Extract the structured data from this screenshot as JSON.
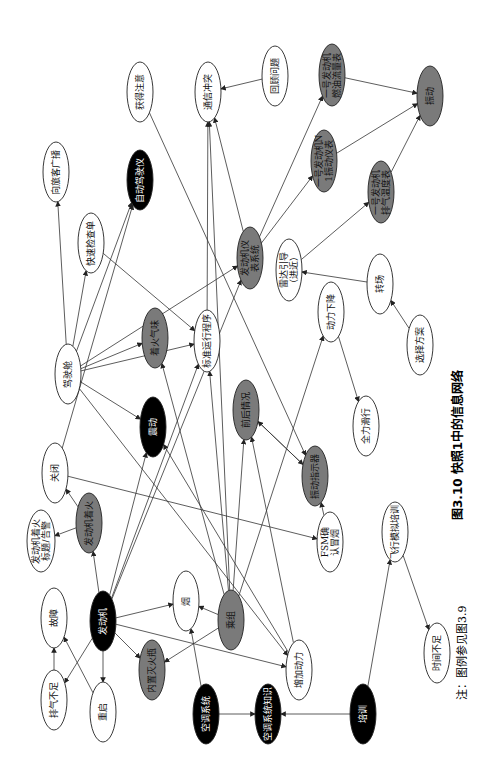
{
  "figure": {
    "caption": "图3.10  快照1中的信息网络",
    "note": "注：图例参见图3.9",
    "orientation": "rotated 90° clockwise"
  },
  "colors": {
    "black": "#000000",
    "gray": "#7a7a7a",
    "white": "#ffffff",
    "edge": "#333333"
  },
  "nodes": [
    {
      "id": "n1",
      "label": "获得注意",
      "fill": "white",
      "cx": 140,
      "cy": 92,
      "rx": 13,
      "ry": 30
    },
    {
      "id": "n2",
      "label": "通信冲突",
      "fill": "white",
      "cx": 208,
      "cy": 92,
      "rx": 13,
      "ry": 30
    },
    {
      "id": "n3",
      "label": "回顾问题",
      "fill": "white",
      "cx": 275,
      "cy": 76,
      "rx": 13,
      "ry": 30
    },
    {
      "id": "n4",
      "label": "一号发动机燃油流量表",
      "fill": "gray",
      "cx": 332,
      "cy": 75,
      "rx": 13,
      "ry": 31
    },
    {
      "id": "n5",
      "label": "振动",
      "fill": "gray",
      "cx": 430,
      "cy": 96,
      "rx": 13,
      "ry": 30
    },
    {
      "id": "n6",
      "label": "一号发动机N1振动仪表",
      "fill": "gray",
      "cx": 324,
      "cy": 161,
      "rx": 13,
      "ry": 31
    },
    {
      "id": "n7",
      "label": "一号发动机排气温度表",
      "fill": "gray",
      "cx": 381,
      "cy": 192,
      "rx": 13,
      "ry": 31
    },
    {
      "id": "n8",
      "label": "向旅客广播",
      "fill": "white",
      "cx": 56,
      "cy": 172,
      "rx": 13,
      "ry": 30
    },
    {
      "id": "n9",
      "label": "自动驾驶仪",
      "fill": "black",
      "cx": 140,
      "cy": 180,
      "rx": 13,
      "ry": 30
    },
    {
      "id": "n10",
      "label": "快速检查单",
      "fill": "white",
      "cx": 91,
      "cy": 243,
      "rx": 13,
      "ry": 30
    },
    {
      "id": "n11",
      "label": "发动机仪表系统",
      "fill": "gray",
      "cx": 250,
      "cy": 258,
      "rx": 13,
      "ry": 31
    },
    {
      "id": "n12",
      "label": "雷达引导（进近）",
      "fill": "white",
      "cx": 289,
      "cy": 270,
      "rx": 13,
      "ry": 31
    },
    {
      "id": "n13",
      "label": "转场",
      "fill": "white",
      "cx": 380,
      "cy": 284,
      "rx": 13,
      "ry": 30
    },
    {
      "id": "n14",
      "label": "驾驶舱",
      "fill": "white",
      "cx": 68,
      "cy": 374,
      "rx": 13,
      "ry": 30
    },
    {
      "id": "n15",
      "label": "着火气味",
      "fill": "gray",
      "cx": 155,
      "cy": 338,
      "rx": 13,
      "ry": 30
    },
    {
      "id": "n16",
      "label": "标准运行程序",
      "fill": "white",
      "cx": 207,
      "cy": 341,
      "rx": 13,
      "ry": 31
    },
    {
      "id": "n17",
      "label": "动力下降",
      "fill": "white",
      "cx": 331,
      "cy": 312,
      "rx": 13,
      "ry": 30
    },
    {
      "id": "n18",
      "label": "选择方案",
      "fill": "white",
      "cx": 420,
      "cy": 345,
      "rx": 13,
      "ry": 30
    },
    {
      "id": "n19",
      "label": "震动",
      "fill": "black",
      "cx": 153,
      "cy": 427,
      "rx": 13,
      "ry": 30
    },
    {
      "id": "n20",
      "label": "前后情况",
      "fill": "gray",
      "cx": 246,
      "cy": 410,
      "rx": 13,
      "ry": 30
    },
    {
      "id": "n21",
      "label": "全力滑行",
      "fill": "white",
      "cx": 366,
      "cy": 426,
      "rx": 13,
      "ry": 30
    },
    {
      "id": "n22",
      "label": "关闭",
      "fill": "white",
      "cx": 55,
      "cy": 473,
      "rx": 13,
      "ry": 30
    },
    {
      "id": "n23",
      "label": "发动机着火",
      "fill": "gray",
      "cx": 89,
      "cy": 523,
      "rx": 13,
      "ry": 30
    },
    {
      "id": "n24",
      "label": "振动指示器",
      "fill": "gray",
      "cx": 315,
      "cy": 476,
      "rx": 13,
      "ry": 30
    },
    {
      "id": "n25",
      "label": "发动机着火标题/告警",
      "fill": "white",
      "cx": 41,
      "cy": 541,
      "rx": 14,
      "ry": 31
    },
    {
      "id": "n26",
      "label": "FSM确认冒烟",
      "fill": "white",
      "cx": 330,
      "cy": 542,
      "rx": 13,
      "ry": 30
    },
    {
      "id": "n27",
      "label": "飞行模拟培训",
      "fill": "white",
      "cx": 395,
      "cy": 532,
      "rx": 13,
      "ry": 30
    },
    {
      "id": "n28",
      "label": "故障",
      "fill": "white",
      "cx": 54,
      "cy": 618,
      "rx": 13,
      "ry": 30
    },
    {
      "id": "n29",
      "label": "发动机",
      "fill": "black",
      "cx": 103,
      "cy": 621,
      "rx": 13,
      "ry": 30
    },
    {
      "id": "n30",
      "label": "烟",
      "fill": "white",
      "cx": 186,
      "cy": 601,
      "rx": 13,
      "ry": 30
    },
    {
      "id": "n31",
      "label": "乘组",
      "fill": "gray",
      "cx": 231,
      "cy": 620,
      "rx": 13,
      "ry": 30
    },
    {
      "id": "n32",
      "label": "增加动力",
      "fill": "white",
      "cx": 299,
      "cy": 670,
      "rx": 13,
      "ry": 30
    },
    {
      "id": "n33",
      "label": "时间不足",
      "fill": "white",
      "cx": 437,
      "cy": 653,
      "rx": 13,
      "ry": 30
    },
    {
      "id": "n34",
      "label": "内置灭火瓶",
      "fill": "gray",
      "cx": 152,
      "cy": 670,
      "rx": 13,
      "ry": 30
    },
    {
      "id": "n35",
      "label": "排气不足",
      "fill": "white",
      "cx": 54,
      "cy": 700,
      "rx": 13,
      "ry": 30
    },
    {
      "id": "n36",
      "label": "重启",
      "fill": "white",
      "cx": 103,
      "cy": 712,
      "rx": 13,
      "ry": 30
    },
    {
      "id": "n37",
      "label": "空调系统",
      "fill": "black",
      "cx": 206,
      "cy": 714,
      "rx": 13,
      "ry": 30
    },
    {
      "id": "n38",
      "label": "空调系统知识",
      "fill": "black",
      "cx": 268,
      "cy": 714,
      "rx": 13,
      "ry": 30
    },
    {
      "id": "n39",
      "label": "培训",
      "fill": "black",
      "cx": 363,
      "cy": 714,
      "rx": 13,
      "ry": 30
    }
  ],
  "edges": [
    [
      "n6",
      "n5"
    ],
    [
      "n4",
      "n5"
    ],
    [
      "n7",
      "n5"
    ],
    [
      "n3",
      "n2"
    ],
    [
      "n11",
      "n4"
    ],
    [
      "n11",
      "n6"
    ],
    [
      "n12",
      "n7"
    ],
    [
      "n11",
      "n2"
    ],
    [
      "n14",
      "n8"
    ],
    [
      "n14",
      "n10"
    ],
    [
      "n14",
      "n9"
    ],
    [
      "n14",
      "n11"
    ],
    [
      "n14",
      "n15"
    ],
    [
      "n14",
      "n16"
    ],
    [
      "n14",
      "n19"
    ],
    [
      "n10",
      "n16"
    ],
    [
      "n13",
      "n12"
    ],
    [
      "n18",
      "n13"
    ],
    [
      "n17",
      "n21"
    ],
    [
      "n16",
      "n2"
    ],
    [
      "n1",
      "n24"
    ],
    [
      "n20",
      "n24"
    ],
    [
      "n24",
      "n20"
    ],
    [
      "n29",
      "n19"
    ],
    [
      "n29",
      "n30"
    ],
    [
      "n29",
      "n34"
    ],
    [
      "n29",
      "n36"
    ],
    [
      "n29",
      "n35"
    ],
    [
      "n29",
      "n16"
    ],
    [
      "n29",
      "n32"
    ],
    [
      "n29",
      "n11"
    ],
    [
      "n31",
      "n34"
    ],
    [
      "n31",
      "n30"
    ],
    [
      "n31",
      "n16"
    ],
    [
      "n31",
      "n20"
    ],
    [
      "n31",
      "n15"
    ],
    [
      "n31",
      "n17"
    ],
    [
      "n31",
      "n2"
    ],
    [
      "n23",
      "n22"
    ],
    [
      "n23",
      "n25"
    ],
    [
      "n29",
      "n23"
    ],
    [
      "n35",
      "n28"
    ],
    [
      "n36",
      "n28"
    ],
    [
      "n37",
      "n38"
    ],
    [
      "n39",
      "n38"
    ],
    [
      "n37",
      "n30"
    ],
    [
      "n39",
      "n27"
    ],
    [
      "n27",
      "n33"
    ],
    [
      "n22",
      "n26"
    ],
    [
      "n14",
      "n32"
    ],
    [
      "n22",
      "n9"
    ],
    [
      "n26",
      "n24"
    ],
    [
      "n32",
      "n19"
    ],
    [
      "n32",
      "n20"
    ]
  ]
}
